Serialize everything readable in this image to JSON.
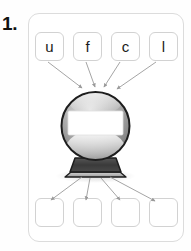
{
  "worksheet": {
    "question_number": "1.",
    "card": {
      "top_tiles": [
        {
          "label": "u",
          "name": "letter-tile-u"
        },
        {
          "label": "f",
          "name": "letter-tile-f"
        },
        {
          "label": "c",
          "name": "letter-tile-c"
        },
        {
          "label": "l",
          "name": "letter-tile-l"
        }
      ],
      "bottom_tiles": [
        {
          "label": "",
          "name": "answer-tile-1"
        },
        {
          "label": "",
          "name": "answer-tile-2"
        },
        {
          "label": "",
          "name": "answer-tile-3"
        },
        {
          "label": "",
          "name": "answer-tile-4"
        }
      ],
      "illustration": {
        "name": "crystal-ball-icon",
        "label_band_text": "",
        "description": "crystal ball with blank white label band on a dark base"
      }
    }
  },
  "colors": {
    "page_background": "#ffffff",
    "card_border": "#dcdcdc",
    "tile_border": "#d2d2d2",
    "tile_fill": "#ffffff",
    "text": "#1a1a1a",
    "number_text": "#111111",
    "arrow": "#9a9a9a",
    "globe_outline": "#1d1d1d",
    "globe_body_light": "#d8d8d8",
    "globe_body_mid": "#9e9e9e",
    "globe_body_dark": "#6e6e6e",
    "globe_highlight": "#f2f2f2",
    "label_band": "#ffffff",
    "base_dark": "#3c3c3c",
    "base_light": "#b9b9b9",
    "shadow": "#e6e6e6"
  }
}
